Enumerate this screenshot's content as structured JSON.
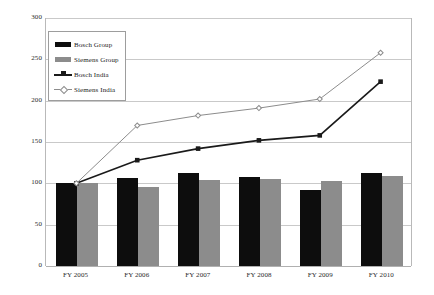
{
  "chart_data": {
    "type": "line",
    "title": "",
    "subtitle": "",
    "xlabel": "",
    "ylabel": "",
    "categories": [
      "FY 2005",
      "FY 2006",
      "FY 2007",
      "FY 2008",
      "FY 2009",
      "FY 2010"
    ],
    "ylim": [
      0,
      300
    ],
    "yticks": [
      0,
      50,
      100,
      150,
      200,
      250,
      300
    ],
    "ytick_labels": [
      "0",
      "50",
      "100",
      "150",
      "200",
      "250",
      "300"
    ],
    "grid": true,
    "legend_position": "top-left",
    "series": [
      {
        "name": "Bosch Group",
        "type": "bar",
        "color": "#0d0d0d",
        "values": [
          100,
          106,
          112,
          108,
          92,
          113
        ]
      },
      {
        "name": "Siemens Group",
        "type": "bar",
        "color": "#8c8c8c",
        "values": [
          100,
          96,
          104,
          105,
          103,
          109
        ]
      },
      {
        "name": "Bosch India",
        "type": "line",
        "color": "#1a1a1a",
        "marker": "square",
        "values": [
          100,
          128,
          142,
          152,
          158,
          223
        ]
      },
      {
        "name": "Siemens India",
        "type": "line",
        "color": "#8c8c8c",
        "marker": "diamond",
        "values": [
          100,
          170,
          182,
          191,
          202,
          258
        ]
      }
    ]
  },
  "legend": {
    "items": [
      {
        "label": "Bosch Group",
        "key": "filled-square-swatch"
      },
      {
        "label": "Siemens Group",
        "key": "filled-square-swatch"
      },
      {
        "label": "Bosch India",
        "key": "line-square-marker"
      },
      {
        "label": "Siemens India",
        "key": "line-diamond-marker"
      }
    ]
  },
  "colors": {
    "bosch_group": "#0d0d0d",
    "siemens_group": "#8c8c8c",
    "bosch_india": "#1a1a1a",
    "siemens_india": "#8c8c8c",
    "gridline": "#c9c9c9",
    "axis": "#b0b0b0",
    "background": "#ffffff"
  }
}
